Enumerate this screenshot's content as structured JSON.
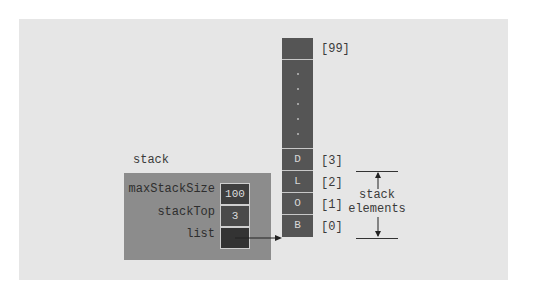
{
  "diagram": {
    "title": "stack",
    "colors": {
      "background": "#ffffff",
      "panel": "#e6e6e6",
      "struct_box": "#8c8c8c",
      "array_cell": "#555555",
      "text": "#3a3a3a"
    },
    "struct": {
      "name": "stack",
      "fields": [
        {
          "label": "maxStackSize",
          "value": "100"
        },
        {
          "label": "stackTop",
          "value": "3"
        },
        {
          "label": "list",
          "value": ""
        }
      ]
    },
    "array": {
      "top": {
        "value": "",
        "index": "[99]"
      },
      "ellipsis_dots": 5,
      "elements": [
        {
          "value": "D",
          "index": "[3]"
        },
        {
          "value": "L",
          "index": "[2]"
        },
        {
          "value": "O",
          "index": "[1]"
        },
        {
          "value": "B",
          "index": "[0]"
        }
      ]
    },
    "annotation": {
      "line1": "stack",
      "line2": "elements"
    }
  }
}
